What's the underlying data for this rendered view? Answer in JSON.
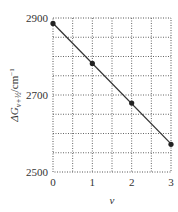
{
  "chart_data": {
    "type": "line",
    "title": "",
    "xlabel": "v",
    "ylabel": "ΔG_{v+1/2}/cm⁻¹",
    "ylabel_parts": {
      "main": "ΔG",
      "sub": "v+½",
      "unit": "/cm",
      "sup": "−1"
    },
    "x": [
      0,
      1,
      2,
      3
    ],
    "series": [
      {
        "name": "ΔG_{v+1/2}",
        "values": [
          2886,
          2782,
          2679,
          2572
        ],
        "markers": true,
        "line": "linear fit"
      }
    ],
    "xlim": [
      0,
      3
    ],
    "ylim": [
      2500,
      2900
    ],
    "x_ticks": [
      0,
      1,
      2,
      3
    ],
    "x_tick_labels": [
      "0",
      "1",
      "2",
      "3"
    ],
    "y_ticks": [
      2500,
      2700,
      2900
    ],
    "y_tick_labels": [
      "2500",
      "2700",
      "2900"
    ],
    "grid": {
      "on": true,
      "style": "dotted",
      "x_step": 0.5,
      "y_step": 50
    },
    "legend": null
  },
  "colors": {
    "line": "#333333",
    "marker": "#222222",
    "grid": "#666666",
    "text": "#333333"
  }
}
